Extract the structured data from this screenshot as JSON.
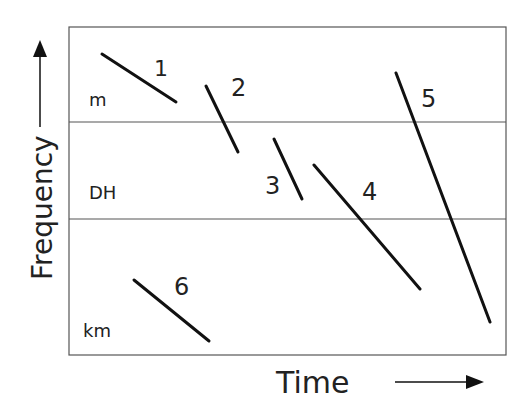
{
  "diagram": {
    "x_axis_label": "Time",
    "y_axis_label": "Frequency",
    "bands": [
      {
        "label": "m"
      },
      {
        "label": "DH"
      },
      {
        "label": "km"
      }
    ],
    "tracks": [
      {
        "label": "1"
      },
      {
        "label": "2"
      },
      {
        "label": "3"
      },
      {
        "label": "4"
      },
      {
        "label": "5"
      },
      {
        "label": "6"
      }
    ],
    "colors": {
      "line": "#111111",
      "frame": "#555555",
      "text": "#222222"
    }
  }
}
